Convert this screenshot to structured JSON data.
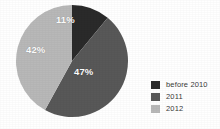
{
  "background_color": "#ffffff",
  "chart_data": {
    "type": "pie",
    "title": "",
    "categories": [
      "before 2010",
      "2011",
      "2012"
    ],
    "values": [
      11,
      47,
      42
    ],
    "value_unit": "%",
    "data_labels": [
      "11%",
      "47%",
      "42%"
    ],
    "colors": [
      "#2a2a2a",
      "#585858",
      "#b8b8b8"
    ],
    "start_angle_deg": 0,
    "direction": "clockwise",
    "legend_position": "right",
    "grid": false,
    "xlabel": "",
    "ylabel": ""
  },
  "pie": {
    "center_x": 57,
    "center_y": 58,
    "radius": 56,
    "slices": [
      {
        "name": "before 2010",
        "label": "11%",
        "value": 11,
        "color": "#2a2a2a"
      },
      {
        "name": "2011",
        "label": "47%",
        "value": 47,
        "color": "#585858"
      },
      {
        "name": "2012",
        "label": "42%",
        "value": 42,
        "color": "#b8b8b8"
      }
    ]
  },
  "legend": {
    "items": [
      {
        "label": "before 2010",
        "color": "#2a2a2a"
      },
      {
        "label": "2011",
        "color": "#585858"
      },
      {
        "label": "2012",
        "color": "#b8b8b8"
      }
    ]
  }
}
